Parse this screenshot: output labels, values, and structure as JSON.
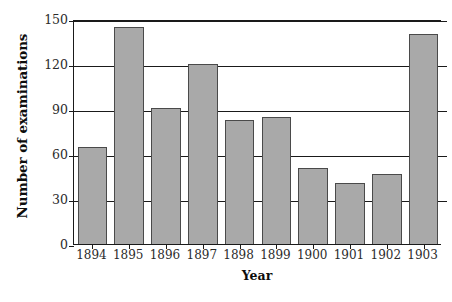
{
  "chart_data": {
    "type": "bar",
    "title": "",
    "xlabel": "Year",
    "ylabel": "Number of examinations",
    "categories": [
      "1894",
      "1895",
      "1896",
      "1897",
      "1898",
      "1899",
      "1900",
      "1901",
      "1902",
      "1903"
    ],
    "values": [
      65,
      145,
      91,
      120,
      83,
      85,
      51,
      41,
      47,
      140
    ],
    "ylim": [
      0,
      150
    ],
    "yticks": [
      0,
      30,
      60,
      90,
      120,
      150
    ],
    "ytick_labels": [
      "0",
      "30",
      "60",
      "90",
      "120",
      "150"
    ],
    "grid": true,
    "grid_axis": "y",
    "legend": false,
    "legend_position": "none",
    "bar_color": "#a9a9a9",
    "bar_edge_color": "#4a4a4a",
    "axis_color": "#1a1a1a",
    "background_color": "#ffffff",
    "series": [
      {
        "name": "Number of examinations",
        "values": [
          65,
          145,
          91,
          120,
          83,
          85,
          51,
          41,
          47,
          140
        ]
      }
    ],
    "points": [
      {
        "category": "1894",
        "value": 65
      },
      {
        "category": "1895",
        "value": 145
      },
      {
        "category": "1896",
        "value": 91
      },
      {
        "category": "1897",
        "value": 120
      },
      {
        "category": "1898",
        "value": 83
      },
      {
        "category": "1899",
        "value": 85
      },
      {
        "category": "1900",
        "value": 51
      },
      {
        "category": "1901",
        "value": 41
      },
      {
        "category": "1902",
        "value": 47
      },
      {
        "category": "1903",
        "value": 140
      }
    ]
  }
}
